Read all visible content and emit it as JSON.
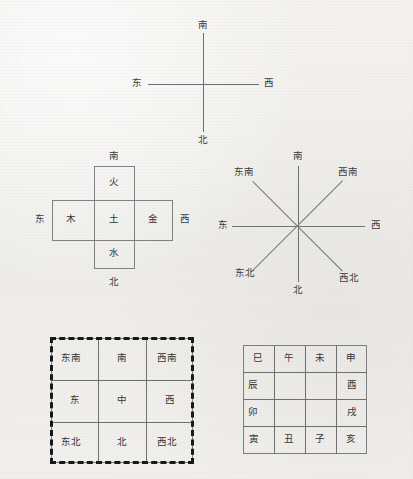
{
  "page": {
    "background_color": "#f2f1ef",
    "ink_color": "#6f6f70"
  },
  "figure_1_simple_cross": {
    "name": "four-direction cross",
    "labels": {
      "top": "南",
      "left": "东",
      "right": "西",
      "bottom": "北"
    }
  },
  "figure_2_five_elements": {
    "name": "five elements plus-shape chart",
    "direction_labels": {
      "top": "南",
      "left": "东",
      "right": "西",
      "bottom": "北"
    },
    "cells": {
      "top": "火",
      "left": "木",
      "center": "土",
      "right": "金",
      "bottom": "水"
    }
  },
  "figure_3_eight_directions": {
    "name": "eight-direction star",
    "labels": {
      "top": "南",
      "bottom": "北",
      "left": "东",
      "right": "西",
      "upper_left": "东南",
      "upper_right": "西南",
      "lower_left": "东北",
      "lower_right": "西北"
    }
  },
  "figure_4_nine_palace_grid": {
    "name": "nine-palace direction grid with dashed border",
    "rows": [
      [
        "东南",
        "南",
        "西南"
      ],
      [
        "东",
        "中",
        "西"
      ],
      [
        "东北",
        "北",
        "西北"
      ]
    ]
  },
  "figure_5_branches_grid": {
    "name": "twelve earthly branches perimeter grid",
    "rows": [
      [
        "巳",
        "午",
        "未",
        "申"
      ],
      [
        "辰",
        "",
        "",
        "酉"
      ],
      [
        "卯",
        "",
        "",
        "戌"
      ],
      [
        "寅",
        "丑",
        "子",
        "亥"
      ]
    ]
  }
}
